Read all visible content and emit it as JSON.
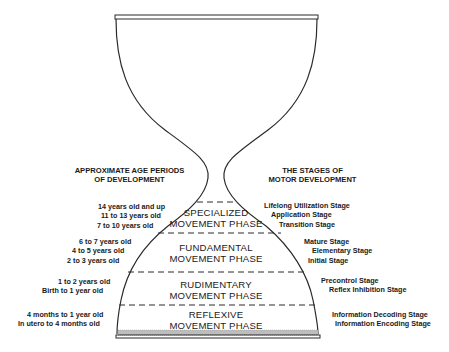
{
  "diagram": {
    "type": "hourglass",
    "left_header": [
      "APPROXIMATE AGE PERIODS",
      "OF DEVELOPMENT"
    ],
    "right_header": [
      "THE STAGES OF",
      "MOTOR DEVELOPMENT"
    ],
    "phases": [
      {
        "name": [
          "SPECIALIZED",
          "MOVEMENT PHASE"
        ],
        "ages": [
          "14 years old and up",
          "11 to 13 years old",
          "7 to 10 years old"
        ],
        "stages": [
          "Lifelong Utilization Stage",
          "Application Stage",
          "Transition Stage"
        ]
      },
      {
        "name": [
          "FUNDAMENTAL",
          "MOVEMENT PHASE"
        ],
        "ages": [
          "6 to 7 years old",
          "4 to 5 years old",
          "2 to 3 years old"
        ],
        "stages": [
          "Mature Stage",
          "Elementary Stage",
          "Initial Stage"
        ]
      },
      {
        "name": [
          "RUDIMENTARY",
          "MOVEMENT PHASE"
        ],
        "ages": [
          "1 to 2 years old",
          "Birth to 1 year old"
        ],
        "stages": [
          "Precontrol Stage",
          "Reflex Inhibition Stage"
        ]
      },
      {
        "name": [
          "REFLEXIVE",
          "MOVEMENT PHASE"
        ],
        "ages": [
          "4 months to 1 year old",
          "In utero to 4 months old"
        ],
        "stages": [
          "Information Decoding Stage",
          "Information Encoding Stage"
        ]
      }
    ],
    "colors": {
      "line": "#2a2a2a",
      "text": "#1a1a1a",
      "sand": "#bdbdbd",
      "background": "#ffffff"
    }
  }
}
